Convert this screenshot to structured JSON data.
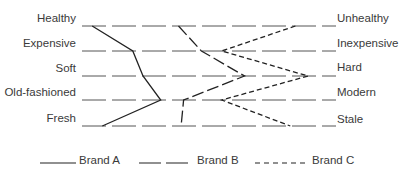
{
  "chart_data": {
    "type": "line",
    "title": "",
    "subtype": "semantic-differential profile",
    "orientation": "horizontal-scales",
    "scales": [
      {
        "left": "Healthy",
        "right": "Unhealthy"
      },
      {
        "left": "Expensive",
        "right": "Inexpensive"
      },
      {
        "left": "Soft",
        "right": "Hard"
      },
      {
        "left": "Old-fashioned",
        "right": "Modern"
      },
      {
        "left": "Fresh",
        "right": "Stale"
      }
    ],
    "xlim": [
      0,
      1
    ],
    "grid": "dashed horizontal rule per scale",
    "legend_position": "bottom",
    "series": [
      {
        "name": "Brand A",
        "style": "solid",
        "values": [
          0.04,
          0.2,
          0.24,
          0.31,
          0.08
        ]
      },
      {
        "name": "Brand B",
        "style": "long-dash",
        "values": [
          0.38,
          0.47,
          0.64,
          0.4,
          0.39
        ]
      },
      {
        "name": "Brand C",
        "style": "short-dash",
        "values": [
          0.84,
          0.55,
          0.89,
          0.55,
          0.82
        ]
      }
    ]
  },
  "layout": {
    "x_left": 82,
    "x_right": 336,
    "rows_y": [
      26,
      51,
      76,
      100,
      126
    ]
  },
  "legend": [
    {
      "label": "Brand A",
      "style": "solid"
    },
    {
      "label": "Brand B",
      "style": "long-dash"
    },
    {
      "label": "Brand C",
      "style": "short-dash"
    }
  ]
}
